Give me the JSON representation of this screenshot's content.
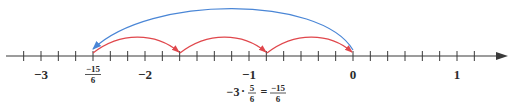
{
  "diagram": {
    "type": "number-line",
    "colors": {
      "axis": "#3a3a3a",
      "small_jump": "#e0474c",
      "total_jump": "#4a86d6",
      "text": "#2b2b2b"
    },
    "axis": {
      "min_label": -3,
      "max_label": 1,
      "tick_step": "1/6",
      "labels": [
        "−3",
        "−2",
        "−1",
        "0",
        "1"
      ]
    },
    "marked_point": {
      "numerator": "−15",
      "denominator": "6"
    },
    "small_jumps": [
      {
        "from": "0",
        "to": "-5/6"
      },
      {
        "from": "-5/6",
        "to": "-10/6"
      },
      {
        "from": "-10/6",
        "to": "-15/6"
      }
    ],
    "total_jump": {
      "from": "0",
      "to": "-15/6"
    },
    "equation": {
      "factor": "−3",
      "dot": "·",
      "fraction_numerator": "5",
      "fraction_denominator": "6",
      "equals": "=",
      "result_numerator": "−15",
      "result_denominator": "6"
    }
  }
}
